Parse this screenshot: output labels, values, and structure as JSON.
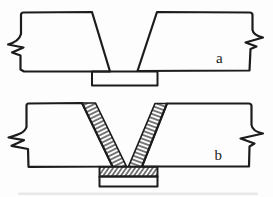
{
  "diagram": {
    "labels": {
      "a": "a",
      "b": "b"
    },
    "colors": {
      "ink": "#1c1c1c",
      "paper": "#fdfdfd"
    }
  }
}
